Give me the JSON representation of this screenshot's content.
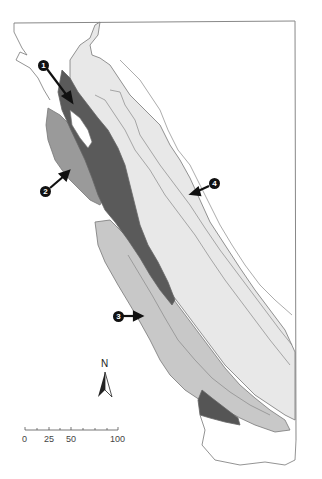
{
  "map": {
    "type": "regional map",
    "colors": {
      "background": "#ffffff",
      "frame": "#888888",
      "outline": "#777777",
      "region_dark": "#5a5a5a",
      "region_medium": "#9a9a9a",
      "region_light": "#c8c8c8",
      "region_lightest": "#e6e6e6"
    },
    "markers": [
      {
        "id": "1",
        "label": "1"
      },
      {
        "id": "2",
        "label": "2"
      },
      {
        "id": "3",
        "label": "3"
      },
      {
        "id": "4",
        "label": "4"
      }
    ],
    "north_arrow": {
      "label": "N"
    },
    "scale_bar": {
      "ticks": [
        "0",
        "25",
        "50",
        "100"
      ]
    }
  }
}
